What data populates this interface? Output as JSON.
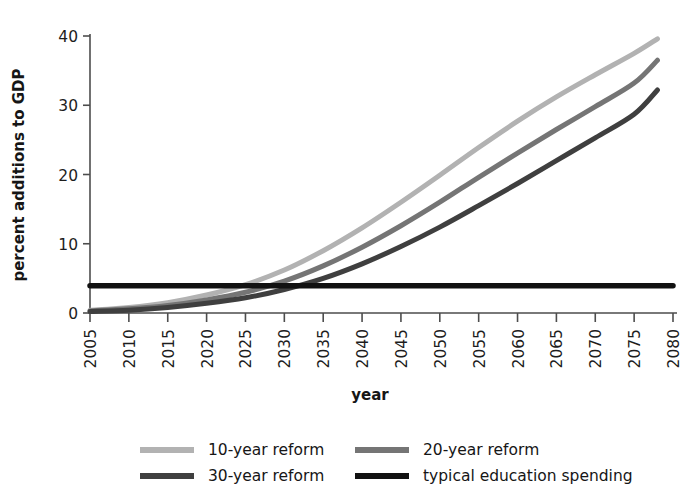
{
  "chart_data": {
    "type": "line",
    "title": "",
    "xlabel": "year",
    "ylabel": "percent additions to GDP",
    "grid": false,
    "xlim": [
      2005,
      2080
    ],
    "ylim": [
      0,
      40
    ],
    "yticks": [
      0,
      10,
      20,
      30,
      40
    ],
    "xticks": [
      2005,
      2010,
      2015,
      2020,
      2025,
      2030,
      2035,
      2040,
      2045,
      2050,
      2055,
      2060,
      2065,
      2070,
      2075,
      2080
    ],
    "x": [
      2005,
      2010,
      2015,
      2020,
      2025,
      2030,
      2035,
      2040,
      2045,
      2050,
      2055,
      2060,
      2065,
      2070,
      2075,
      2078
    ],
    "legend_position": "below",
    "series": [
      {
        "name": "10-year reform",
        "color": "#b2b2b2",
        "width": 5.0,
        "values": [
          0.4,
          0.8,
          1.5,
          2.6,
          4.1,
          6.2,
          9.0,
          12.3,
          16.0,
          19.9,
          23.9,
          27.7,
          31.2,
          34.4,
          37.5,
          39.6
        ]
      },
      {
        "name": "20-year reform",
        "color": "#757575",
        "width": 5.0,
        "values": [
          0.3,
          0.6,
          1.1,
          1.9,
          3.0,
          4.6,
          6.8,
          9.5,
          12.6,
          16.0,
          19.6,
          23.1,
          26.5,
          29.8,
          33.2,
          36.5
        ]
      },
      {
        "name": "30-year reform",
        "color": "#3f3f3f",
        "width": 5.0,
        "values": [
          0.2,
          0.4,
          0.8,
          1.4,
          2.2,
          3.4,
          5.0,
          7.1,
          9.6,
          12.4,
          15.5,
          18.7,
          22.0,
          25.3,
          28.7,
          32.2
        ]
      },
      {
        "name": "typical education spending",
        "color": "#111111",
        "width": 5.5,
        "constant": 3.95,
        "values": [
          3.95,
          3.95,
          3.95,
          3.95,
          3.95,
          3.95,
          3.95,
          3.95,
          3.95,
          3.95,
          3.95,
          3.95,
          3.95,
          3.95,
          3.95,
          3.95
        ]
      }
    ],
    "legend_entries": [
      {
        "label": "10-year reform",
        "color": "#b2b2b2"
      },
      {
        "label": "20-year reform",
        "color": "#757575"
      },
      {
        "label": "30-year reform",
        "color": "#3f3f3f"
      },
      {
        "label": "typical education spending",
        "color": "#111111"
      }
    ]
  },
  "axis": {
    "y_label": "percent additions to GDP",
    "x_label": "year",
    "y_tick_labels": [
      "0",
      "10",
      "20",
      "30",
      "40"
    ],
    "x_tick_labels": [
      "2005",
      "2010",
      "2015",
      "2020",
      "2025",
      "2030",
      "2035",
      "2040",
      "2045",
      "2050",
      "2055",
      "2060",
      "2065",
      "2070",
      "2075",
      "2080"
    ],
    "axis_color": "#4d4d4d"
  }
}
